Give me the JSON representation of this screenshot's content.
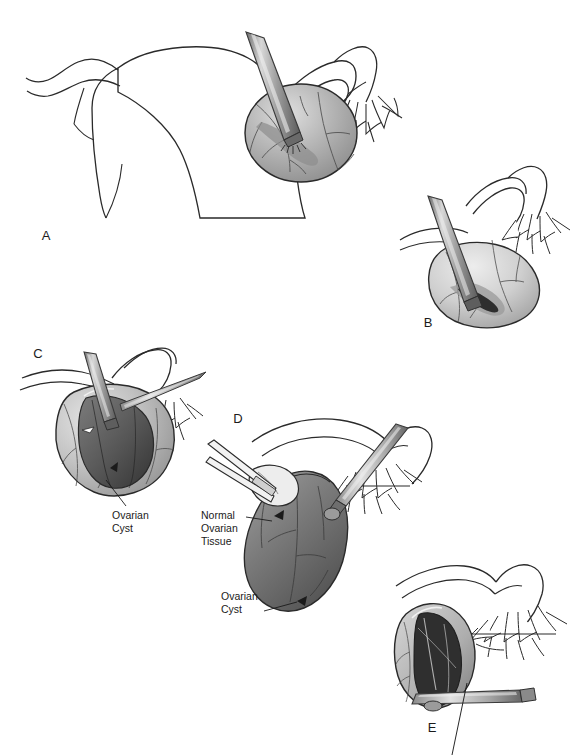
{
  "figure": {
    "title": "Ovarian Cystectomy",
    "subtitle": "Stepwise laparoscopic ovarian cystectomy",
    "style": "grayscale medical line-and-wash illustration",
    "background_color": "#ffffff",
    "ink_color": "#1b1b1b",
    "width": 583,
    "height": 755
  },
  "panels": [
    {
      "id": "A",
      "letter": "A",
      "letter_x": 46,
      "letter_y": 240,
      "caption": "Uterus, fallopian tube and ovary with cautery applied to ovarian cortex",
      "structures": [
        "uterus",
        "fallopian-tube",
        "fimbriae",
        "ovary",
        "cautery-probe",
        "ovarian-vessels"
      ]
    },
    {
      "id": "B",
      "letter": "B",
      "letter_x": 428,
      "letter_y": 327,
      "caption": "Incision made through the ovarian cortex",
      "structures": [
        "fallopian-tube",
        "fimbriae",
        "ovary",
        "cortical-incision",
        "cautery-probe"
      ]
    },
    {
      "id": "C",
      "letter": "C",
      "letter_x": 38,
      "letter_y": 358,
      "caption": "Cortex opened exposing the cyst wall; dissection begun",
      "structures": [
        "ovary",
        "open-cortex",
        "cyst-wall",
        "grasper",
        "probe",
        "fimbriae"
      ]
    },
    {
      "id": "D",
      "letter": "D",
      "letter_x": 238,
      "letter_y": 423,
      "caption": "Cyst stripped free from normal ovarian tissue using traction and counter-traction",
      "structures": [
        "ovary",
        "normal-ovarian-tissue",
        "ovarian-cyst",
        "grasper-upper",
        "grasper-lower",
        "fimbriae"
      ]
    },
    {
      "id": "E",
      "letter": "E",
      "letter_x": 432,
      "letter_y": 732,
      "caption": "Ovarian bed after cyst removal; hemostasis obtained",
      "structures": [
        "ovary",
        "ovarian-bed",
        "cautery-instrument",
        "fallopian-tube",
        "fimbriae"
      ]
    }
  ],
  "annotations": [
    {
      "id": "c-ovarian-cyst",
      "lines": [
        "Ovarian",
        "Cyst"
      ],
      "text": "Ovarian Cyst",
      "text_x": 112,
      "text_y": 519,
      "leader": {
        "x1": 126,
        "y1": 506,
        "x2": 106,
        "y2": 480
      },
      "panel": "C"
    },
    {
      "id": "d-normal-ovarian-tissue",
      "lines": [
        "Normal",
        "Ovarian",
        "Tissue"
      ],
      "text": "Normal Ovarian Tissue",
      "text_x": 201,
      "text_y": 519,
      "leader": {
        "x1": 246,
        "y1": 517,
        "x2": 272,
        "y2": 521
      },
      "panel": "D"
    },
    {
      "id": "d-ovarian-cyst",
      "lines": [
        "Ovarian",
        "Cyst"
      ],
      "text": "Ovarian Cyst",
      "text_x": 221,
      "text_y": 600,
      "leader": {
        "x1": 264,
        "y1": 611,
        "x2": 297,
        "y2": 602
      },
      "panel": "D"
    },
    {
      "id": "e-cut-off-leader",
      "lines": [],
      "text": "",
      "text_x": 0,
      "text_y": 0,
      "leader": {
        "x1": 467,
        "y1": 683,
        "x2": 452,
        "y2": 755
      },
      "panel": "E"
    }
  ],
  "header_fragment": {
    "visible": true,
    "note": "faint clipped text row at very top edge of page",
    "items": [
      {
        "text": "Ovarian Cystectomy",
        "x": 6
      },
      {
        "text": "·",
        "x": 92
      },
      {
        "text": "·",
        "x": 128
      },
      {
        "text": "—",
        "x": 224
      },
      {
        "text": "—",
        "x": 262
      },
      {
        "text": "—",
        "x": 300
      }
    ]
  },
  "palette": {
    "ink": "#1b1b1b",
    "outline": "#2a2a2a",
    "tissue_light": "#e9e9e9",
    "tissue_mid": "#b8b8b8",
    "tissue_dark": "#8a8a8a",
    "cyst_dark": "#5e5e5e",
    "cyst_darkest": "#3a3a3a",
    "instrument_light": "#d6d6d6",
    "instrument_mid": "#9a9a9a",
    "instrument_dark": "#5a5a5a",
    "vessel": "#4a4a4a",
    "background": "#ffffff"
  }
}
